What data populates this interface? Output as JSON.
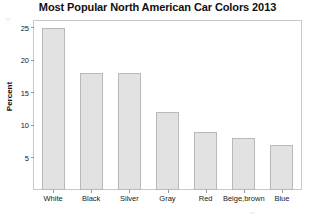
{
  "chart_data": {
    "type": "bar",
    "title": "Most Popular North American Car Colors 2013",
    "xlabel": "",
    "ylabel": "Percent",
    "categories": [
      "White",
      "Black",
      "Silver",
      "Gray",
      "Red",
      "Beige,brown",
      "Blue"
    ],
    "values": [
      25,
      18,
      18,
      12,
      9,
      8,
      7
    ],
    "ylim": [
      0,
      26
    ],
    "yticks": [
      5,
      10,
      15,
      20,
      25
    ],
    "ytick_labels": [
      "5",
      "10",
      "15",
      "20",
      "25"
    ],
    "grid": false,
    "legend": null,
    "bar_color": "#e2e2e2",
    "bar_edge_color": "#b9b9b9",
    "axis_color": "#c9c9c9",
    "text_color": "#1a1a1a"
  }
}
